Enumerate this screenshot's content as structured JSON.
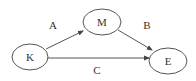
{
  "diagram": {
    "type": "directed-graph",
    "colors": {
      "stroke": "#555555",
      "text": "#333333",
      "background": "#ffffff"
    },
    "nodes": [
      {
        "id": "K",
        "label": "K"
      },
      {
        "id": "M",
        "label": "M"
      },
      {
        "id": "E",
        "label": "E"
      }
    ],
    "edges": [
      {
        "from": "K",
        "to": "M",
        "label": "A"
      },
      {
        "from": "M",
        "to": "E",
        "label": "B"
      },
      {
        "from": "K",
        "to": "E",
        "label": "C"
      }
    ]
  }
}
